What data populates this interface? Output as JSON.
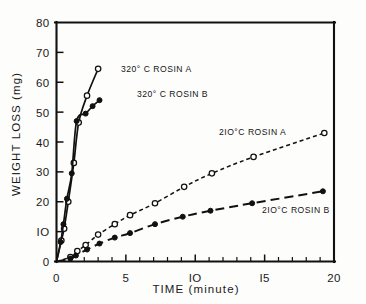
{
  "chart_data": {
    "type": "line",
    "title": "",
    "xlabel": "TIME (minute)",
    "ylabel": "WEIGHT LOSS (mg)",
    "xlim": [
      0,
      20
    ],
    "ylim": [
      0,
      80
    ],
    "xticks": [
      0,
      5,
      10,
      15,
      20
    ],
    "xtick_labels": [
      "0",
      "5",
      "IO",
      "I5",
      "20"
    ],
    "yticks": [
      0,
      10,
      20,
      30,
      40,
      50,
      60,
      70,
      80
    ],
    "ytick_labels": [
      "0",
      "IO",
      "20",
      "30",
      "40",
      "50",
      "60",
      "70",
      "80"
    ],
    "xminor_step": 1,
    "grid": false,
    "legend_position": "inline-annotations",
    "series": [
      {
        "name": "320° C  ROSIN A",
        "marker": "open-circle",
        "line_style": "solid",
        "x": [
          0.35,
          0.55,
          0.85,
          1.25,
          1.6,
          2.2,
          3.0
        ],
        "y": [
          7.0,
          11.0,
          20.0,
          33.0,
          46.5,
          55.5,
          64.5
        ]
      },
      {
        "name": "320° C  ROSIN B",
        "marker": "filled-circle",
        "line_style": "solid",
        "x": [
          0.3,
          0.5,
          0.75,
          1.1,
          1.45,
          2.1,
          2.6,
          3.1
        ],
        "y": [
          6.5,
          12.5,
          21.0,
          29.5,
          47.0,
          49.5,
          52.0,
          54.0
        ]
      },
      {
        "name": "2IO°C  ROSIN A",
        "marker": "open-circle",
        "line_style": "short-dash",
        "x": [
          1.0,
          1.5,
          2.1,
          3.0,
          4.2,
          5.3,
          7.1,
          9.2,
          11.2,
          14.2,
          19.3
        ],
        "y": [
          1.5,
          3.5,
          5.5,
          9.0,
          12.5,
          15.5,
          19.5,
          25.0,
          29.5,
          35.0,
          43.0
        ]
      },
      {
        "name": "2IO°C  ROSIN B",
        "marker": "filled-circle",
        "line_style": "long-dash",
        "x": [
          1.0,
          1.4,
          2.2,
          3.1,
          4.2,
          5.3,
          7.1,
          9.1,
          11.1,
          14.1,
          19.2
        ],
        "y": [
          1.0,
          2.0,
          4.0,
          6.0,
          8.0,
          9.5,
          12.5,
          15.0,
          17.0,
          19.5,
          23.5
        ]
      }
    ],
    "annotations": [
      {
        "text": "320° C  ROSIN A",
        "x_px": 121,
        "y_px": 72
      },
      {
        "text": "320° C  ROSIN B",
        "x_px": 137,
        "y_px": 97
      },
      {
        "text": "2IO°C  ROSIN A",
        "x_px": 219,
        "y_px": 135
      },
      {
        "text": "2IO°C  ROSIN B",
        "x_px": 262,
        "y_px": 213
      }
    ]
  }
}
